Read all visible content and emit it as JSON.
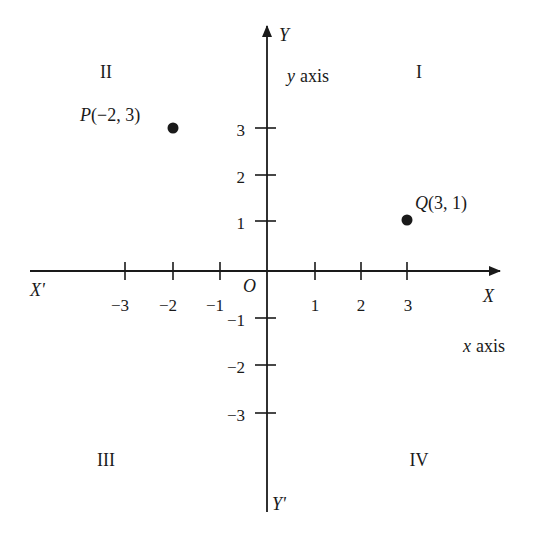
{
  "diagram": {
    "type": "cartesian-plane",
    "origin_label": "O",
    "x_axis": {
      "positive_label": "X",
      "negative_label": "X'",
      "name": "x axis",
      "name_var": "x",
      "name_word": "axis",
      "ticks": [
        -3,
        -2,
        -1,
        1,
        2,
        3
      ],
      "tick_labels": [
        "−3",
        "−2",
        "−1",
        "1",
        "2",
        "3"
      ]
    },
    "y_axis": {
      "positive_label": "Y",
      "negative_label": "Y'",
      "name": "y axis",
      "name_var": "y",
      "name_word": "axis",
      "ticks": [
        3,
        2,
        1,
        -1,
        -2,
        -3
      ],
      "tick_labels": [
        "3",
        "2",
        "1",
        "−1",
        "−2",
        "−3"
      ]
    },
    "quadrants": {
      "I": "I",
      "II": "II",
      "III": "III",
      "IV": "IV"
    },
    "points": [
      {
        "name": "P",
        "x": -2,
        "y": 3,
        "label": "P",
        "coords": "(−2, 3)"
      },
      {
        "name": "Q",
        "x": 3,
        "y": 1,
        "label": "Q",
        "coords": "(3, 1)"
      }
    ],
    "colors": {
      "ink": "#1a1a1a",
      "background": "#ffffff"
    }
  }
}
